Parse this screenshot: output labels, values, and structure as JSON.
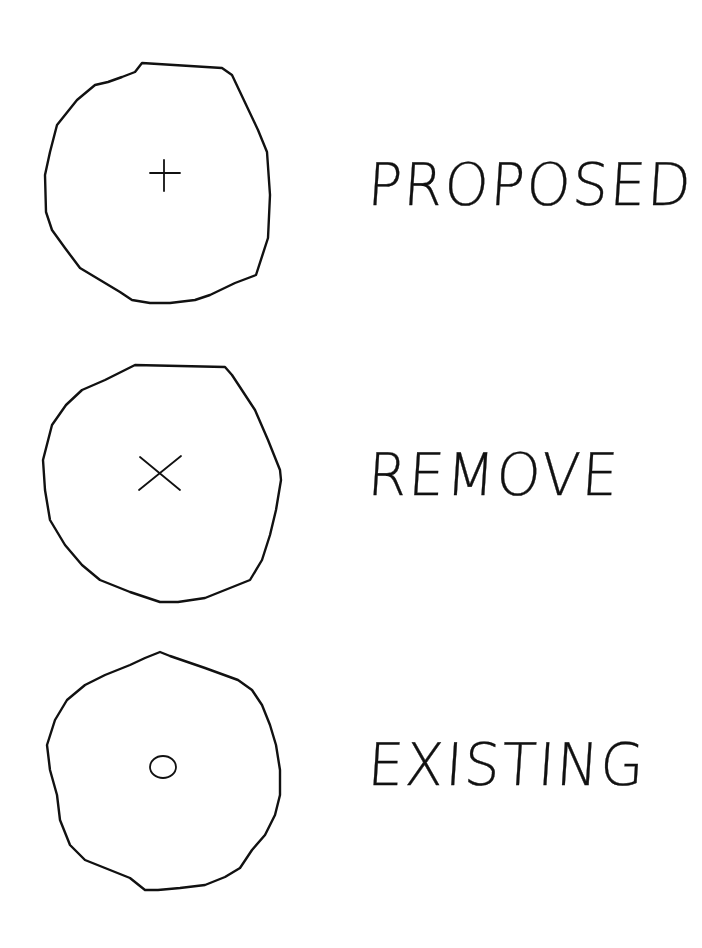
{
  "legend": {
    "items": [
      {
        "symbol": "circle-plus-icon",
        "center_mark": "+",
        "label": "PROPOSED"
      },
      {
        "symbol": "circle-x-icon",
        "center_mark": "×",
        "label": "REMOVE"
      },
      {
        "symbol": "circle-dot-icon",
        "center_mark": "o",
        "label": "EXISTING"
      }
    ]
  },
  "colors": {
    "ink": "#111111",
    "paper": "#ffffff"
  }
}
